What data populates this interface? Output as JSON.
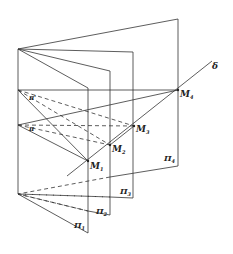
{
  "diagram": {
    "type": "geometry-pencil-of-planes",
    "line_label": "δ",
    "planes": [
      {
        "label": "Π",
        "sub": "1"
      },
      {
        "label": "Π",
        "sub": "2"
      },
      {
        "label": "Π",
        "sub": "3"
      },
      {
        "label": "Π",
        "sub": "4"
      }
    ],
    "points": [
      {
        "label": "M",
        "sub": "1"
      },
      {
        "label": "M",
        "sub": "2"
      },
      {
        "label": "M",
        "sub": "3"
      },
      {
        "label": "M",
        "sub": "4"
      }
    ],
    "projection_planes": [
      {
        "label": "π'"
      },
      {
        "label": "π"
      }
    ],
    "colors": {
      "line": "#333333",
      "background": "#ffffff"
    }
  }
}
